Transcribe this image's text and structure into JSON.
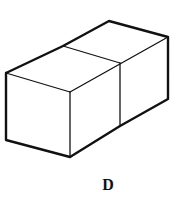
{
  "figure": {
    "label": "D",
    "stroke_color": "#111111",
    "vertices": {
      "left_top": [
        6,
        73
      ],
      "left_bottom": [
        6,
        140
      ],
      "front_top": [
        70,
        92
      ],
      "front_bottom": [
        70,
        157
      ],
      "mid_top": [
        120,
        63
      ],
      "mid_bottom": [
        120,
        126
      ],
      "right_top": [
        168,
        37
      ],
      "right_bottom": [
        168,
        99
      ],
      "back_top_left": [
        63,
        46
      ],
      "back_top_right": [
        109,
        21
      ]
    }
  }
}
